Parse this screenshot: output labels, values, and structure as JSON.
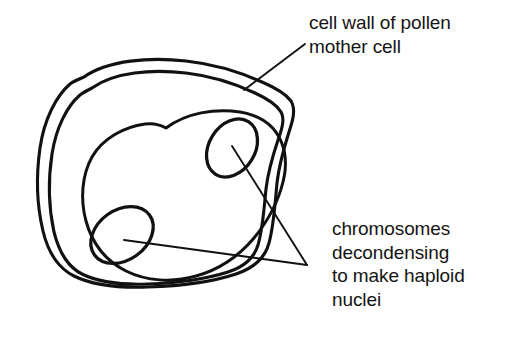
{
  "figure": {
    "background_color": "#ffffff",
    "ink_color": "#111111",
    "text_color": "#141414",
    "width": 505,
    "height": 349
  },
  "labels": {
    "cell_wall": {
      "text": "cell wall of pollen\nmother cell",
      "lines": [
        "cell wall of pollen",
        "mother cell"
      ]
    },
    "chromosomes": {
      "text": "chromosomes\ndecondensing\nto make haploid\nnuclei",
      "lines": [
        "chromosomes",
        "decondensing",
        "to make haploid",
        "nuclei"
      ]
    }
  },
  "structures": {
    "outer_wall": "outer cell wall contour",
    "inner_wall": "inner cell wall contour",
    "inner_oval": "inner membrane oval",
    "chromosome_mass_upper": "upper decondensing chromosome mass",
    "chromosome_mass_lower": "lower decondensing chromosome mass"
  },
  "leaders": {
    "cell_wall_leader": "line from cell wall label to outer wall",
    "chromosome_leader_upper": "line from chromosomes label to upper chromosome mass",
    "chromosome_leader_lower": "line from chromosomes label to lower chromosome mass"
  }
}
